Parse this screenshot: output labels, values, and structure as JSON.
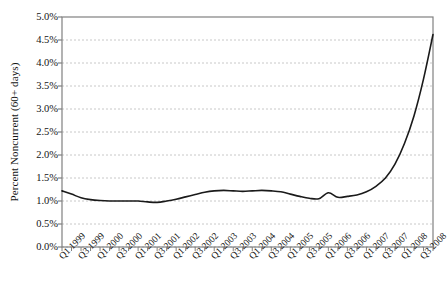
{
  "chart_data": {
    "type": "line",
    "title": "",
    "xlabel": "",
    "ylabel": "Percent Noncurrent (60+ days)",
    "ylim": [
      0.0,
      5.0
    ],
    "ytick_labels": [
      "0.0%",
      "0.5%",
      "1.0%",
      "1.5%",
      "2.0%",
      "2.5%",
      "3.0%",
      "3.5%",
      "4.0%",
      "4.5%",
      "5.0%"
    ],
    "ytick_values": [
      0.0,
      0.5,
      1.0,
      1.5,
      2.0,
      2.5,
      3.0,
      3.5,
      4.0,
      4.5,
      5.0
    ],
    "grid": "horizontal-dashed",
    "legend": "none",
    "line_color": "#1a1a1a",
    "axis_color": "#808080",
    "grid_color": "#c8c8c8",
    "background": "#ffffff",
    "xtick_labels": [
      "Q1 1999",
      "Q3 1999",
      "Q1 2000",
      "Q3 2000",
      "Q1 2001",
      "Q3 2001",
      "Q1 2002",
      "Q3 2002",
      "Q1 2003",
      "Q3 2003",
      "Q1 2004",
      "Q3 2004",
      "Q1 2005",
      "Q3 2005",
      "Q1 2006",
      "Q3 2006",
      "Q1 2007",
      "Q3 2007",
      "Q1 2008",
      "Q3 2008"
    ],
    "x": [
      "Q1 1999",
      "Q2 1999",
      "Q3 1999",
      "Q4 1999",
      "Q1 2000",
      "Q2 2000",
      "Q3 2000",
      "Q4 2000",
      "Q1 2001",
      "Q2 2001",
      "Q3 2001",
      "Q4 2001",
      "Q1 2002",
      "Q2 2002",
      "Q3 2002",
      "Q4 2002",
      "Q1 2003",
      "Q2 2003",
      "Q3 2003",
      "Q4 2003",
      "Q1 2004",
      "Q2 2004",
      "Q3 2004",
      "Q4 2004",
      "Q1 2005",
      "Q2 2005",
      "Q3 2005",
      "Q4 2005",
      "Q1 2006",
      "Q2 2006",
      "Q3 2006",
      "Q4 2006",
      "Q1 2007",
      "Q2 2007",
      "Q3 2007",
      "Q4 2007",
      "Q1 2008",
      "Q2 2008",
      "Q3 2008",
      "Q4 2008"
    ],
    "values": [
      1.22,
      1.15,
      1.07,
      1.03,
      1.01,
      1.0,
      1.0,
      1.0,
      1.0,
      0.98,
      0.97,
      1.0,
      1.04,
      1.09,
      1.14,
      1.19,
      1.22,
      1.23,
      1.22,
      1.21,
      1.22,
      1.23,
      1.22,
      1.2,
      1.15,
      1.1,
      1.06,
      1.05,
      1.18,
      1.08,
      1.1,
      1.13,
      1.2,
      1.32,
      1.5,
      1.8,
      2.25,
      2.85,
      3.65,
      4.62
    ],
    "series_name": "Percent Noncurrent (60+ days)"
  }
}
